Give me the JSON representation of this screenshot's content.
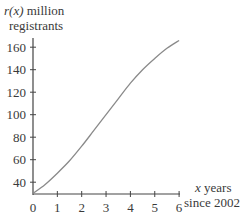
{
  "chart_data": {
    "type": "line",
    "title": "",
    "ylabel_func": "r(x)",
    "ylabel_line1_rest": " million",
    "ylabel_line2": "registrants",
    "xlabel_var": "x",
    "xlabel_line1_rest": " years",
    "xlabel_line2": "since 2002",
    "x_ticks": [
      "0",
      "1",
      "2",
      "3",
      "4",
      "5",
      "6"
    ],
    "y_ticks": [
      "40",
      "60",
      "80",
      "100",
      "120",
      "140",
      "160"
    ],
    "xlim": [
      0,
      6
    ],
    "ylim": [
      30,
      170
    ],
    "grid": false,
    "series": [
      {
        "name": "r(x)",
        "x": [
          0,
          0.5,
          1,
          1.5,
          2,
          2.5,
          3,
          3.5,
          4,
          4.5,
          5,
          5.5,
          6
        ],
        "values": [
          30,
          38,
          48,
          59,
          72,
          86,
          100,
          114,
          128,
          140,
          150,
          159,
          166
        ]
      }
    ],
    "colors": {
      "axis": "#444444",
      "curve": "#8a8a8a",
      "text": "#3a3a3a"
    }
  }
}
